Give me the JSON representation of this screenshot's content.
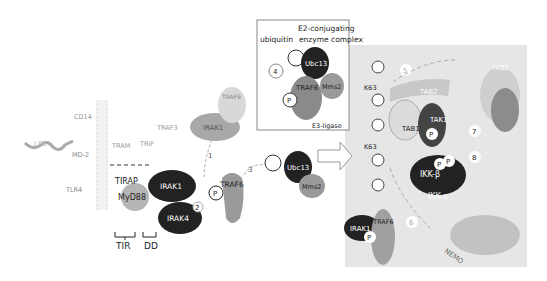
{
  "figure": {
    "receptor": {
      "lps": "LPS",
      "md2": "MD-2",
      "cd14": "CD14",
      "tlr4": "TLR4",
      "tram": "TRAM",
      "trif": "TRIF",
      "traf3": "TRAF3",
      "tirap": "TIRAP",
      "myd88": "MyD88",
      "tir_domain": "TIR",
      "dd_domain": "DD"
    },
    "kinases": {
      "irak1": "IRAK1",
      "irak4": "IRAK4",
      "traf6": "TRAF6",
      "phospho": "P"
    },
    "steps": [
      "1",
      "2",
      "3",
      "4",
      "5",
      "6",
      "7",
      "8"
    ],
    "inset": {
      "title_line1": "E2-conjugating",
      "title_line2": "enzyme complex",
      "ubiquitin": "ubiquitin",
      "ubc13": "Ubc13",
      "mms2": "Mms2",
      "traf6": "TRAF6",
      "e3": "E3-ligase",
      "phospho": "P"
    },
    "complex": {
      "k63": "K63",
      "tab2": "TAB2",
      "tab1": "TAB1",
      "tak1": "TAK1",
      "ikk_beta": "IKK-β",
      "ikk_alpha": "IKK-α",
      "nemo": "NEMO",
      "irak1": "IRAK1",
      "traf6": "TRAF6",
      "phospho": "P"
    },
    "colors": {
      "dark": "#2a2a2a",
      "mid": "#8a8a8a",
      "light": "#c4c4c4",
      "panel": "#e4e4e4"
    }
  }
}
